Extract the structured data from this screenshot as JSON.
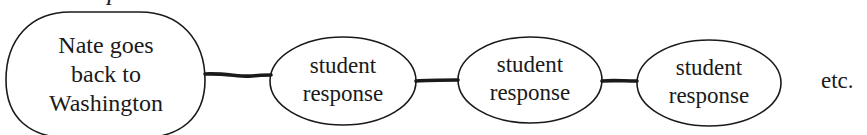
{
  "diagram": {
    "label": "Example:",
    "nodes": [
      {
        "id": "main",
        "lines": [
          "Nate goes",
          "back to",
          "Washington"
        ]
      },
      {
        "id": "response-1",
        "lines": [
          "student",
          "response"
        ]
      },
      {
        "id": "response-2",
        "lines": [
          "student",
          "response"
        ]
      },
      {
        "id": "response-3",
        "lines": [
          "student",
          "response"
        ]
      }
    ],
    "connectors": [
      {
        "from": "main",
        "to": "response-1"
      },
      {
        "from": "response-1",
        "to": "response-2"
      },
      {
        "from": "response-2",
        "to": "response-3"
      }
    ],
    "trailing_text": "etc.",
    "colors": {
      "stroke": "#1a1a1a",
      "background": "#ffffff",
      "text": "#1a1a1a"
    }
  }
}
